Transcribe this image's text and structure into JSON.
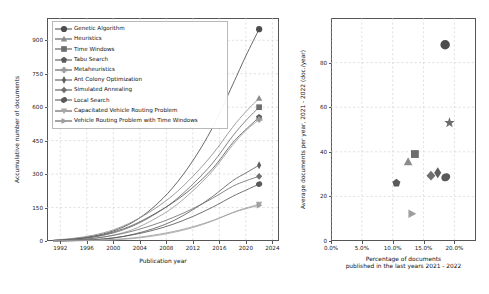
{
  "figure": {
    "background": "#ffffff",
    "width": 489,
    "height": 294
  },
  "left_panel": {
    "legend_title": "",
    "legend_items": [
      {
        "label": "Genetic Algorithm",
        "marker": "circle",
        "color": "#4d4d4d"
      },
      {
        "label": "Heuristics",
        "marker": "triangle-up",
        "color": "#8c8c8c"
      },
      {
        "label": "Time Windows",
        "marker": "square",
        "color": "#6e6e6e"
      },
      {
        "label": "Tabu Search",
        "marker": "pentagon",
        "color": "#5a5a5a"
      },
      {
        "label": "Metaheuristics",
        "marker": "plus-thin",
        "color": "#9a9a9a"
      },
      {
        "label": "Ant Colony Optimization",
        "marker": "diamond-thin",
        "color": "#5f5f5f"
      },
      {
        "label": "Simulated Annealing",
        "marker": "diamond",
        "color": "#707070"
      },
      {
        "label": "Local Search",
        "marker": "ellipse",
        "color": "#595959"
      },
      {
        "label": "Capacitated Vehicle Routing Problem",
        "marker": "triangle-down",
        "color": "#a8a8a8"
      },
      {
        "label": "Vehicle Routing Problem with Time Windows",
        "marker": "triangle-right",
        "color": "#9e9e9e"
      }
    ]
  },
  "chart_data": [
    {
      "id": "accumulative-documents",
      "type": "line",
      "title": "",
      "xlabel": "Publication year",
      "ylabel": "Accumulative number of documents",
      "xlim": [
        1990,
        2025
      ],
      "ylim": [
        0,
        1000
      ],
      "xticks": [
        1992,
        1996,
        2000,
        2004,
        2008,
        2012,
        2016,
        2020,
        2024
      ],
      "yticks": [
        0,
        150,
        300,
        450,
        600,
        750,
        900
      ],
      "grid": true,
      "legend_position": "upper left",
      "x": [
        1991,
        1994,
        1997,
        2000,
        2003,
        2006,
        2009,
        2012,
        2015,
        2018,
        2020,
        2022
      ],
      "series": [
        {
          "name": "Genetic Algorithm",
          "marker": "circle",
          "color": "#4d4d4d",
          "values": [
            3,
            10,
            22,
            45,
            85,
            150,
            240,
            360,
            510,
            700,
            830,
            950
          ],
          "end_value": 950
        },
        {
          "name": "Heuristics",
          "marker": "triangle-up",
          "color": "#8c8c8c",
          "values": [
            4,
            12,
            26,
            50,
            88,
            140,
            205,
            290,
            390,
            510,
            580,
            640
          ],
          "end_value": 640
        },
        {
          "name": "Time Windows",
          "marker": "square",
          "color": "#6e6e6e",
          "values": [
            2,
            7,
            17,
            36,
            68,
            115,
            175,
            255,
            350,
            470,
            540,
            600
          ],
          "end_value": 600
        },
        {
          "name": "Tabu Search",
          "marker": "pentagon",
          "color": "#5a5a5a",
          "values": [
            2,
            8,
            19,
            40,
            72,
            118,
            172,
            240,
            325,
            440,
            500,
            555
          ],
          "end_value": 555
        },
        {
          "name": "Metaheuristics",
          "marker": "plus-thin",
          "color": "#9a9a9a",
          "values": [
            1,
            4,
            11,
            26,
            52,
            95,
            150,
            225,
            315,
            430,
            495,
            545
          ],
          "end_value": 545
        },
        {
          "name": "Ant Colony Optimization",
          "marker": "diamond-thin",
          "color": "#5f5f5f",
          "values": [
            0,
            2,
            5,
            13,
            30,
            55,
            90,
            140,
            200,
            270,
            305,
            340
          ],
          "end_value": 340
        },
        {
          "name": "Simulated Annealing",
          "marker": "diamond",
          "color": "#707070",
          "values": [
            1,
            5,
            12,
            25,
            45,
            72,
            105,
            145,
            192,
            245,
            270,
            290
          ],
          "end_value": 290
        },
        {
          "name": "Local Search",
          "marker": "ellipse",
          "color": "#595959",
          "values": [
            0,
            2,
            6,
            14,
            28,
            48,
            75,
            110,
            152,
            200,
            228,
            255
          ],
          "end_value": 255
        },
        {
          "name": "Capacitated Vehicle Routing Problem",
          "marker": "triangle-down",
          "color": "#a8a8a8",
          "values": [
            0,
            1,
            2,
            5,
            11,
            22,
            38,
            60,
            90,
            128,
            148,
            165
          ],
          "end_value": 165
        },
        {
          "name": "Vehicle Routing Problem with Time Windows",
          "marker": "triangle-right",
          "color": "#9e9e9e",
          "values": [
            0,
            1,
            3,
            7,
            14,
            26,
            42,
            64,
            92,
            126,
            145,
            160
          ],
          "end_value": 160
        }
      ]
    },
    {
      "id": "avg-documents-vs-recency",
      "type": "scatter",
      "title": "",
      "xlabel": "Percentage of documents\npublished in the last years 2021 - 2022",
      "xlabel_line1": "Percentage of documents",
      "xlabel_line2": "published in the last years 2021 - 2022",
      "ylabel": "Average documents per year, 2021 - 2022 (doc./year)",
      "xlim": [
        0,
        23.5
      ],
      "ylim": [
        0,
        100
      ],
      "xticks": [
        0.0,
        5.0,
        10.0,
        15.0,
        20.0
      ],
      "xticklabels": [
        "0.0%",
        "5.0%",
        "10.0%",
        "15.0%",
        "20.0%"
      ],
      "yticks": [
        0,
        20,
        40,
        60,
        80
      ],
      "grid": true,
      "points": [
        {
          "name": "Genetic Algorithm",
          "marker": "circle",
          "color": "#4d4d4d",
          "x": 18.5,
          "y": 88.0,
          "size": 9.5
        },
        {
          "name": "Heuristics",
          "marker": "star",
          "color": "#6b6b6b",
          "x": 19.2,
          "y": 53.0,
          "size": 9.5
        },
        {
          "name": "Time Windows",
          "marker": "square",
          "color": "#6e6e6e",
          "x": 13.6,
          "y": 39.0,
          "size": 8.5
        },
        {
          "name": "Metaheuristics",
          "marker": "triangle-up",
          "color": "#8c8c8c",
          "x": 12.5,
          "y": 35.5,
          "size": 8.5
        },
        {
          "name": "Simulated Annealing",
          "marker": "diamond",
          "color": "#707070",
          "x": 16.2,
          "y": 29.3,
          "size": 9.0
        },
        {
          "name": "Ant Colony Optimization",
          "marker": "diamond-tall",
          "color": "#5f5f5f",
          "x": 17.3,
          "y": 30.6,
          "size": 9.0
        },
        {
          "name": "Local Search",
          "marker": "ellipse",
          "color": "#595959",
          "x": 18.6,
          "y": 28.6,
          "size": 9.0
        },
        {
          "name": "Tabu Search",
          "marker": "pentagon",
          "color": "#5a5a5a",
          "x": 10.6,
          "y": 26.0,
          "size": 8.0
        },
        {
          "name": "Capacitated Vehicle Routing Problem",
          "marker": "triangle-right",
          "color": "#9e9e9e",
          "x": 13.1,
          "y": 12.2,
          "size": 8.5
        }
      ]
    }
  ]
}
